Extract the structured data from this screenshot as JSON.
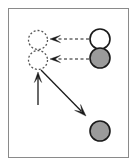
{
  "figure": {
    "canvas": {
      "width": 137,
      "height": 166
    },
    "frame": {
      "name": "figure-border",
      "x": 8,
      "y": 8,
      "width": 121,
      "height": 150,
      "stroke": "#8a8a8a",
      "stroke_width": 1,
      "fill": "#ffffff"
    },
    "colors": {
      "background": "#ffffff",
      "outline": "#1a1a1a",
      "gray_fill": "#9b9b9b",
      "white_fill": "#ffffff",
      "frame_stroke": "#8a8a8a",
      "dashed_outline": "#555555"
    },
    "nodes": [
      {
        "id": "ghost-top",
        "name": "dashed-circle-top",
        "label": "",
        "cx": 38,
        "cy": 40,
        "r": 9.5,
        "fill": "#ffffff",
        "stroke": "#555555",
        "stroke_width": 1.3,
        "stroke_style": "dashed",
        "dash_pattern": "2,2"
      },
      {
        "id": "ghost-bottom",
        "name": "dashed-circle-bottom",
        "label": "",
        "cx": 38,
        "cy": 60,
        "r": 9.5,
        "fill": "#ffffff",
        "stroke": "#555555",
        "stroke_width": 1.3,
        "stroke_style": "dashed",
        "dash_pattern": "2,2"
      },
      {
        "id": "solid-white",
        "name": "white-circle",
        "label": "",
        "cx": 100,
        "cy": 39,
        "r": 10,
        "fill": "#ffffff",
        "stroke": "#1a1a1a",
        "stroke_width": 1.6,
        "stroke_style": "solid",
        "dash_pattern": ""
      },
      {
        "id": "solid-gray-upper",
        "name": "gray-circle-upper",
        "label": "",
        "cx": 100,
        "cy": 58,
        "r": 10,
        "fill": "#9b9b9b",
        "stroke": "#1a1a1a",
        "stroke_width": 1.6,
        "stroke_style": "solid",
        "dash_pattern": ""
      },
      {
        "id": "solid-gray-lower",
        "name": "gray-circle-lower",
        "label": "",
        "cx": 100,
        "cy": 131,
        "r": 10,
        "fill": "#9b9b9b",
        "stroke": "#1a1a1a",
        "stroke_width": 1.6,
        "stroke_style": "solid",
        "dash_pattern": ""
      }
    ],
    "arrows": [
      {
        "id": "arrow-dashed-top",
        "name": "dashed-arrow-top",
        "label": "",
        "x1": 89,
        "y1": 39,
        "x2": 50,
        "y2": 39,
        "stroke": "#1a1a1a",
        "stroke_width": 1.2,
        "stroke_style": "dashed",
        "dash_pattern": "3,2.5",
        "head": "end",
        "head_size": 7
      },
      {
        "id": "arrow-dashed-bottom",
        "name": "dashed-arrow-bottom",
        "label": "",
        "x1": 89,
        "y1": 59,
        "x2": 50,
        "y2": 59,
        "stroke": "#1a1a1a",
        "stroke_width": 1.2,
        "stroke_style": "dashed",
        "dash_pattern": "3,2.5",
        "head": "end",
        "head_size": 7
      },
      {
        "id": "arrow-vertical",
        "name": "upward-arrow",
        "label": "",
        "x1": 38,
        "y1": 105,
        "x2": 38,
        "y2": 72,
        "stroke": "#1a1a1a",
        "stroke_width": 1.3,
        "stroke_style": "solid",
        "dash_pattern": "",
        "head": "end",
        "head_size": 7
      },
      {
        "id": "arrow-diagonal",
        "name": "diagonal-arrow",
        "label": "",
        "x1": 41,
        "y1": 70,
        "x2": 86,
        "y2": 116,
        "stroke": "#1a1a1a",
        "stroke_width": 1.3,
        "stroke_style": "solid",
        "dash_pattern": "",
        "head": "end",
        "head_size": 8
      }
    ]
  }
}
